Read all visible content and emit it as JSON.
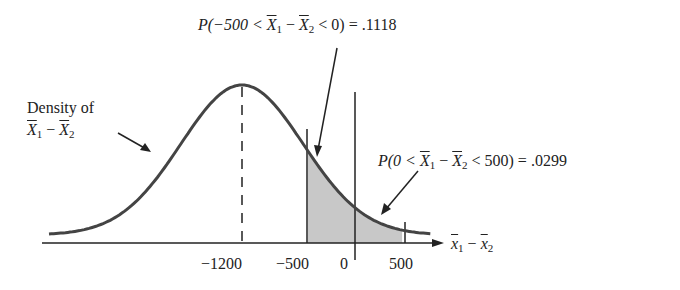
{
  "chart_data": {
    "type": "area",
    "title": "",
    "distribution": {
      "family": "normal",
      "mean": -1200,
      "sd": 650
    },
    "xlabel": "x̄1 − x̄2",
    "ylabel": "",
    "x_ticks": [
      -1200,
      -500,
      0,
      500
    ],
    "x_tick_labels": [
      "−1200",
      "−500",
      "0",
      "500"
    ],
    "shaded_regions": [
      {
        "from": -500,
        "to": 0,
        "probability": 0.1118,
        "label": "P(−500 < X̄1 − X̄2 < 0) = .1118"
      },
      {
        "from": 0,
        "to": 500,
        "probability": 0.0299,
        "label": "P(0 < X̄1 − X̄2 < 500) = .0299"
      }
    ],
    "annotations": [
      "Density of X̄1 − X̄2"
    ],
    "reference_lines": [
      {
        "x": -1200,
        "style": "dashed"
      },
      {
        "x": 0,
        "style": "solid"
      }
    ],
    "grid": false,
    "legend": "none"
  },
  "labels": {
    "density_line1": "Density of",
    "ann1_prefix": "P(−500 <",
    "ann1_mid": "−",
    "ann1_suffix": "< 0)  =  .1118",
    "ann2_prefix": "P(0 <",
    "ann2_mid": "−",
    "ann2_suffix": "< 500)  =  .0299",
    "X": "X",
    "x": "x",
    "sub1": "1",
    "sub2": "2",
    "minus": "−",
    "tick_m1200": "−1200",
    "tick_m500": "−500",
    "tick_0": "0",
    "tick_500": "500"
  }
}
